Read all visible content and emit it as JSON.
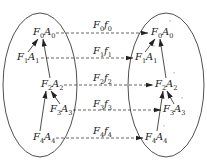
{
  "diagram": {
    "type": "mapping",
    "left_set": {
      "nodes": [
        {
          "id": "F0A0",
          "base1": "F",
          "sub1": "0",
          "base2": "A",
          "sub2": "0"
        },
        {
          "id": "F1A1",
          "base1": "F",
          "sub1": "1",
          "base2": "A",
          "sub2": "1"
        },
        {
          "id": "F2A2",
          "base1": "F",
          "sub1": "2",
          "base2": "A",
          "sub2": "2"
        },
        {
          "id": "F3A3",
          "base1": "F",
          "sub1": "3",
          "base2": "A",
          "sub2": "3"
        },
        {
          "id": "F4A4",
          "base1": "F",
          "sub1": "4",
          "base2": "A",
          "sub2": "4"
        }
      ],
      "edges": [
        {
          "from": "F1A1",
          "to": "F0A0"
        },
        {
          "from": "F2A2",
          "to": "F0A0"
        },
        {
          "from": "F3A3",
          "to": "F2A2"
        },
        {
          "from": "F4A4",
          "to": "F2A2"
        }
      ]
    },
    "right_set": {
      "nodes": [
        {
          "id": "F0A0'",
          "base1": "F",
          "sub1": "0",
          "base2": "A",
          "sub2": "0",
          "prime": "′"
        },
        {
          "id": "F1A1'",
          "base1": "F",
          "sub1": "1",
          "base2": "A",
          "sub2": "1",
          "prime": "′"
        },
        {
          "id": "F2A2'",
          "base1": "F",
          "sub1": "2",
          "base2": "A",
          "sub2": "2",
          "prime": "′"
        },
        {
          "id": "F3A3'",
          "base1": "F",
          "sub1": "3",
          "base2": "A",
          "sub2": "3",
          "prime": "′"
        },
        {
          "id": "F4A4'",
          "base1": "F",
          "sub1": "4",
          "base2": "A",
          "sub2": "4",
          "prime": "′"
        }
      ],
      "edges": [
        {
          "from": "F1A1'",
          "to": "F0A0'"
        },
        {
          "from": "F2A2'",
          "to": "F0A0'"
        },
        {
          "from": "F3A3'",
          "to": "F2A2'"
        },
        {
          "from": "F4A4'",
          "to": "F2A2'"
        }
      ]
    },
    "mappings": [
      {
        "from": "F0A0",
        "to": "F0A0'",
        "base1": "F",
        "sub1": "0",
        "base2": "f",
        "sub2": "0"
      },
      {
        "from": "F1A1",
        "to": "F1A1'",
        "base1": "F",
        "sub1": "1",
        "base2": "f",
        "sub2": "1"
      },
      {
        "from": "F2A2",
        "to": "F2A2'",
        "base1": "F",
        "sub1": "2",
        "base2": "f",
        "sub2": "2"
      },
      {
        "from": "F3A3",
        "to": "F3A3'",
        "base1": "F",
        "sub1": "3",
        "base2": "f",
        "sub2": "3"
      },
      {
        "from": "F4A4",
        "to": "F4A4'",
        "base1": "F",
        "sub1": "4",
        "base2": "f",
        "sub2": "4"
      }
    ],
    "colors": {
      "stroke": "#222222",
      "background": "#ffffff"
    }
  }
}
